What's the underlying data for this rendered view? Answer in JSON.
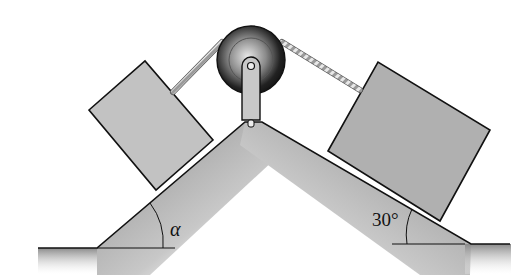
{
  "diagram": {
    "left_incline": {
      "angle_label": "α"
    },
    "right_incline": {
      "angle_label": "30°"
    },
    "elements": [
      "left-block",
      "right-block",
      "pulley",
      "rope",
      "wedge-ground"
    ]
  },
  "colors": {
    "block_fill": "#bdbdbd",
    "ground_fill": "#9a9a9a",
    "pulley_dark": "#1a1a1a",
    "outline": "#111111"
  }
}
